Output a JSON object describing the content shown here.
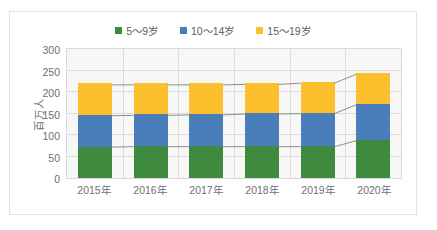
{
  "chart_data": {
    "type": "bar",
    "subtype": "stacked-column",
    "title": "",
    "xlabel": "",
    "ylabel": "百万人",
    "ylim": [
      0,
      300
    ],
    "yticks": [
      300,
      250,
      200,
      150,
      100,
      50,
      0
    ],
    "grid": true,
    "legend_position": "top-center",
    "connector_lines": true,
    "categories": [
      "2015年",
      "2016年",
      "2017年",
      "2018年",
      "2019年",
      "2020年"
    ],
    "series": [
      {
        "name": "5～9岁",
        "color": "#3E8A3E",
        "values": [
          73,
          74,
          74,
          74,
          74,
          88
        ]
      },
      {
        "name": "10～14岁",
        "color": "#4A7EBB",
        "values": [
          74,
          74,
          75,
          77,
          78,
          85
        ]
      },
      {
        "name": "15～19岁",
        "color": "#FCBF2E",
        "values": [
          73,
          72,
          71,
          70,
          72,
          72
        ]
      }
    ],
    "totals": [
      220,
      220,
      220,
      221,
      224,
      245
    ]
  },
  "legend": {
    "items": [
      {
        "label": "5～9岁",
        "color": "#3E8A3E"
      },
      {
        "label": "10～14岁",
        "color": "#4A7EBB"
      },
      {
        "label": "15～19岁",
        "color": "#FCBF2E"
      }
    ]
  },
  "axes": {
    "y_title": "百万人",
    "y_ticks": [
      "300",
      "250",
      "200",
      "150",
      "100",
      "50",
      "0"
    ],
    "x_ticks": [
      "2015年",
      "2016年",
      "2017年",
      "2018年",
      "2019年",
      "2020年"
    ]
  }
}
